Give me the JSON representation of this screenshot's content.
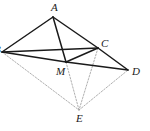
{
  "figure": {
    "width": 150,
    "height": 131,
    "background_color": "#ffffff",
    "solid_stroke_color": "#1a1a1a",
    "dashed_stroke_color": "#9a9a9a",
    "label_color": "#1a1a1a"
  },
  "points": {
    "A": {
      "label": "A",
      "x": 53,
      "y": 17,
      "label_x": 51,
      "label_y": 2
    },
    "B": {
      "label": "B",
      "x": 2,
      "y": 52,
      "label_x": -6,
      "label_y": 44
    },
    "C": {
      "label": "C",
      "x": 98,
      "y": 48,
      "label_x": 101,
      "label_y": 38
    },
    "D": {
      "label": "D",
      "x": 128,
      "y": 70,
      "label_x": 132,
      "label_y": 66
    },
    "M": {
      "label": "M",
      "x": 66,
      "y": 62,
      "label_x": 56,
      "label_y": 66
    },
    "E": {
      "label": "E",
      "x": 79,
      "y": 110,
      "label_x": 76,
      "label_y": 113
    }
  },
  "edges": {
    "solid": [
      {
        "name": "segment-AB",
        "from": "A",
        "to": "B"
      },
      {
        "name": "segment-AC",
        "from": "A",
        "to": "C"
      },
      {
        "name": "segment-AM",
        "from": "A",
        "to": "M"
      },
      {
        "name": "segment-BC",
        "from": "B",
        "to": "C"
      },
      {
        "name": "segment-BM",
        "from": "B",
        "to": "M"
      },
      {
        "name": "segment-MC",
        "from": "M",
        "to": "C"
      },
      {
        "name": "segment-MD",
        "from": "M",
        "to": "D"
      },
      {
        "name": "segment-CD",
        "from": "C",
        "to": "D"
      }
    ],
    "dashed": [
      {
        "name": "segment-BE",
        "from": "B",
        "to": "E"
      },
      {
        "name": "segment-ME",
        "from": "M",
        "to": "E"
      },
      {
        "name": "segment-CE",
        "from": "C",
        "to": "E"
      },
      {
        "name": "segment-ED",
        "from": "E",
        "to": "D"
      }
    ]
  }
}
